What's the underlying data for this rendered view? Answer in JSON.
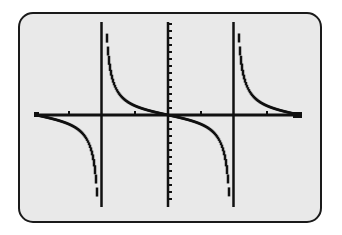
{
  "chart_data": {
    "type": "line",
    "title": "",
    "function": "y = -tan(x)",
    "xlabel": "",
    "ylabel": "",
    "xlim": [
      -3.1416,
      3.1416
    ],
    "ylim": [
      -5,
      5
    ],
    "x_axis_tick_spacing": "pi/4",
    "vertical_asymptotes": [
      -1.5708,
      1.5708
    ],
    "zeros": [
      -3.1416,
      0,
      3.1416
    ],
    "grid": false,
    "legend": null,
    "series": [
      {
        "name": "-tan(x)",
        "style": "dotted-pixel",
        "branches": [
          {
            "x": [
              -3.1416,
              -2.75,
              -2.36,
              -2.0,
              -1.75,
              -1.65
            ],
            "y": [
              0,
              -0.41,
              -1.0,
              -2.19,
              -5.47,
              -12.4
            ]
          },
          {
            "x": [
              -1.49,
              -1.4,
              -1.2,
              -0.8,
              -0.4,
              0,
              0.4,
              0.8,
              1.2,
              1.4,
              1.49
            ],
            "y": [
              12.4,
              5.8,
              2.57,
              1.03,
              0.42,
              0,
              -0.42,
              -1.03,
              -2.57,
              -5.8,
              -12.4
            ]
          },
          {
            "x": [
              1.65,
              1.75,
              2.0,
              2.36,
              2.75,
              3.1416
            ],
            "y": [
              12.4,
              5.47,
              2.19,
              1.0,
              0.41,
              0
            ]
          }
        ]
      }
    ]
  },
  "screen": {
    "background": "#e9e9e9",
    "ink": "#111111",
    "frame": "#1a1a1a"
  },
  "geometry": {
    "x_axis_y": 115,
    "x_axis_from": 35,
    "x_axis_to": 302,
    "y_axis_x": 168,
    "y_axis_from": 22,
    "y_axis_to": 207,
    "asymptote_xs": [
      101.5,
      233.5
    ],
    "x_ticks": [
      69,
      135,
      201,
      267
    ],
    "px_per_unit_x": 42.02,
    "px_per_unit_y": 9.2
  },
  "caption": "Graph of y = -tan x"
}
